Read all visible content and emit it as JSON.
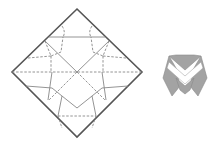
{
  "figure": {
    "title": "",
    "crease_pattern": {
      "description": "Square origami crease pattern rotated 45 degrees with mountain (solid) and valley (dashed) folds",
      "colors": {
        "edge": "#555555",
        "crease": "#888888"
      }
    },
    "folded_model": {
      "description": "Folded origami result: gray shape with white V-shaped band",
      "colors": {
        "fill": "#a0a0a0",
        "stroke": "#888888",
        "band": "#ffffff"
      }
    }
  }
}
